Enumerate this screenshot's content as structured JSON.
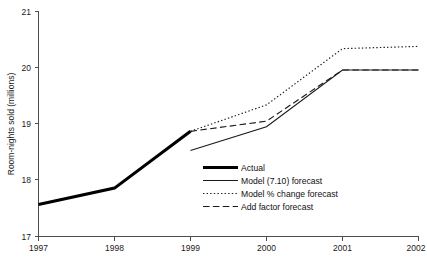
{
  "chart_data": {
    "type": "line",
    "title": "",
    "xlabel": "",
    "ylabel": "Room-nights sold (millions)",
    "x": [
      1997,
      1998,
      1999,
      2000,
      2001,
      2002
    ],
    "xtick_labels": [
      "1997",
      "1998",
      "1999",
      "2000",
      "2001",
      "2002"
    ],
    "ytick_labels": [
      "17",
      "18",
      "19",
      "20",
      "21"
    ],
    "ytick_values": [
      17,
      18,
      19,
      20,
      21
    ],
    "xlim": [
      1997,
      2002
    ],
    "ylim": [
      17,
      21
    ],
    "grid": false,
    "legend_position": "inside-center-lower",
    "series": [
      {
        "name": "Actual",
        "style": "thick-solid",
        "x": [
          1997,
          1998,
          1999
        ],
        "values": [
          17.57,
          17.86,
          18.87
        ]
      },
      {
        "name": "Model (7.10) forecast",
        "style": "solid",
        "x": [
          1999,
          2000,
          2001,
          2002
        ],
        "values": [
          18.53,
          18.95,
          19.96,
          19.96
        ]
      },
      {
        "name": "Model % change forecast",
        "style": "dotted",
        "x": [
          1999,
          2000,
          2001,
          2002
        ],
        "values": [
          18.87,
          19.34,
          20.34,
          20.38
        ]
      },
      {
        "name": "Add factor forecast",
        "style": "dashed",
        "x": [
          1999,
          2000,
          2001,
          2002
        ],
        "values": [
          18.87,
          19.05,
          19.96,
          19.96
        ]
      }
    ]
  },
  "legend": {
    "items": [
      {
        "label": "Actual"
      },
      {
        "label": "Model (7.10) forecast"
      },
      {
        "label": "Model % change forecast"
      },
      {
        "label": "Add factor forecast"
      }
    ]
  },
  "axes": {
    "y_title": "Room-nights sold (millions)",
    "y_ticks": [
      "21",
      "20",
      "19",
      "18",
      "17"
    ],
    "x_ticks": [
      "1997",
      "1998",
      "1999",
      "2000",
      "2001",
      "2002"
    ]
  },
  "colors": {
    "axis": "#4d4d4d",
    "series": "#1a1a1a",
    "actual": "#000000",
    "background": "#ffffff"
  }
}
